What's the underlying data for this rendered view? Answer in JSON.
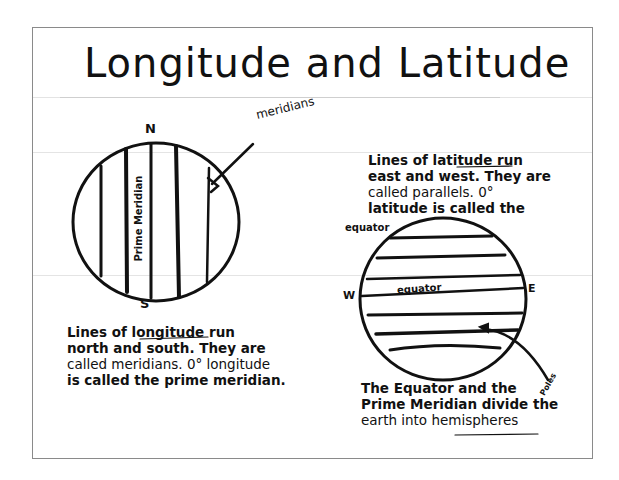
{
  "document": {
    "title": "Longitude and Latitude",
    "left_globe": {
      "top_label": "N",
      "bottom_label": "S",
      "callout": "meridians",
      "vertical_label": "Prime Meridian"
    },
    "right_globe": {
      "west_label": "W",
      "east_label": "E",
      "inner_label": "equator",
      "outer_label": "equator",
      "arrow_label": "Poles"
    },
    "longitude_note": {
      "lines": [
        "Lines of longitude run",
        "north and south. They are",
        "called meridians. 0° longitude",
        "is called the prime meridian."
      ],
      "underlined_word": "longitude"
    },
    "latitude_note": {
      "lines": [
        "Lines of latitude run",
        "east and west. They are",
        "called parallels. 0°",
        "latitude is called the"
      ],
      "underlined_word": "latitude"
    },
    "hemisphere_note": {
      "lines": [
        "The  Equator and the",
        "Prime Meridian divide the",
        "earth into hemispheres"
      ],
      "underlined_word": "hemispheres"
    },
    "colors": {
      "ink": "#111111",
      "border": "#8a8a8a",
      "fold_line": "#e4e4e4",
      "paper": "#ffffff"
    }
  }
}
